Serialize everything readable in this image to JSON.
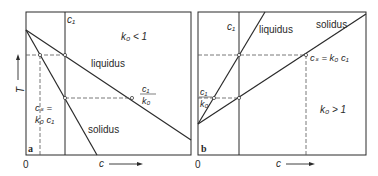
{
  "figure": {
    "panel_a": {
      "tag": "a",
      "condition": "k₀ < 1",
      "concentration_label": "c₁",
      "liquidus_label": "liquidus",
      "solidus_label": "solidus",
      "liquid_point_numerator": "c₁",
      "liquid_point_denominator": "k₀",
      "solid_point_line1": "cₛ =",
      "solid_point_line2": "k₀ c₁",
      "x_axis_label": "c",
      "y_axis_label": "T",
      "origin_label": "0"
    },
    "panel_b": {
      "tag": "b",
      "condition": "k₀ > 1",
      "concentration_label": "c₁",
      "liquidus_label": "liquidus",
      "solidus_label": "solidus",
      "liquid_point_numerator": "c₁",
      "liquid_point_denominator": "k₀",
      "solid_point_label": "cₛ = k₀ c₁",
      "x_axis_label": "c",
      "origin_label": "0"
    },
    "colors": {
      "line": "#2a2a2a",
      "dashed": "#555555",
      "background": "#ffffff"
    }
  }
}
